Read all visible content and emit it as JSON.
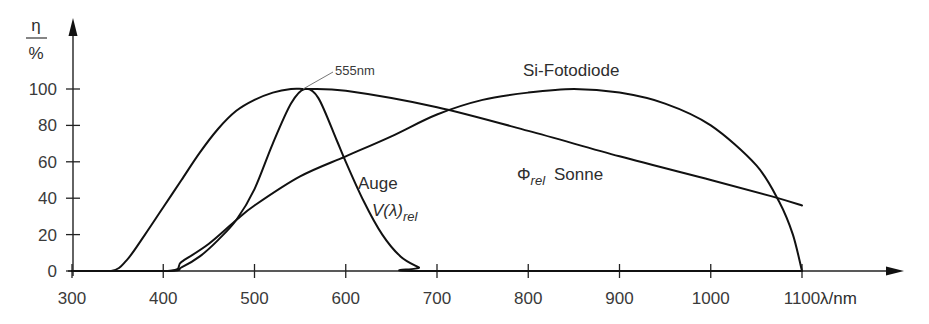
{
  "chart_data": {
    "type": "line",
    "title": "",
    "xlabel": "λ/nm",
    "ylabel_top": "η",
    "ylabel_bottom": "%",
    "xlim": [
      300,
      1100
    ],
    "ylim": [
      0,
      100
    ],
    "x_ticks": [
      300,
      400,
      500,
      600,
      700,
      800,
      900,
      1000,
      1100
    ],
    "y_ticks": [
      0,
      20,
      40,
      60,
      80,
      100
    ],
    "grid": false,
    "legend": "inline annotations",
    "annotations": {
      "peak_marker": "555nm",
      "si_label": "Si-Fotodiode",
      "eye_label_1": "Auge",
      "eye_label_2_main": "V(λ)",
      "eye_label_2_sub": "rel",
      "sun_label_symbol": "Φ",
      "sun_label_sub": "rel",
      "sun_label_text": "Sonne"
    },
    "series": [
      {
        "name": "Auge V(λ)rel",
        "x": [
          300,
          405,
          420,
          440,
          460,
          480,
          500,
          520,
          540,
          555,
          570,
          590,
          600,
          620,
          640,
          660,
          680,
          690,
          1100
        ],
        "values": [
          0,
          0,
          2,
          8,
          17,
          28,
          45,
          70,
          92,
          100,
          95,
          72,
          60,
          38,
          20,
          8,
          2,
          0,
          0
        ]
      },
      {
        "name": "Φrel Sonne",
        "x": [
          300,
          343,
          360,
          380,
          400,
          420,
          440,
          460,
          480,
          500,
          520,
          540,
          555,
          600,
          700,
          800,
          900,
          1000,
          1067,
          1100
        ],
        "values": [
          0,
          0,
          6,
          20,
          35,
          50,
          65,
          78,
          88,
          94,
          98,
          100,
          100,
          99,
          90,
          77,
          63,
          50,
          41,
          36
        ]
      },
      {
        "name": "Si-Fotodiode",
        "x": [
          300,
          405,
          420,
          450,
          480,
          500,
          550,
          600,
          650,
          700,
          750,
          800,
          850,
          900,
          950,
          1000,
          1050,
          1075,
          1090,
          1100
        ],
        "values": [
          0,
          0,
          5,
          15,
          28,
          36,
          52,
          63,
          74,
          86,
          94,
          98,
          100,
          98,
          92,
          80,
          58,
          38,
          20,
          0
        ]
      }
    ]
  }
}
